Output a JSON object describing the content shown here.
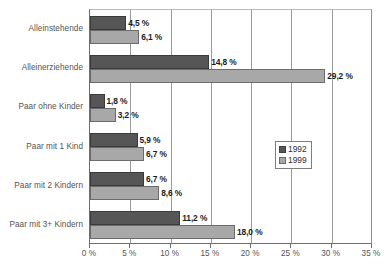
{
  "chart_data": {
    "type": "bar",
    "orientation": "horizontal",
    "title": "",
    "subtitle": "",
    "xlabel": "",
    "ylabel": "",
    "categories": [
      "Alleinstehende",
      "Alleinerziehende",
      "Paar ohne Kinder",
      "Paar mit 1 Kind",
      "Paar mit 2 Kindern",
      "Paar mit 3+ Kindern"
    ],
    "series": [
      {
        "name": "1992",
        "color": "#565656",
        "values": [
          4.5,
          14.8,
          1.8,
          5.9,
          6.7,
          11.2
        ],
        "labels": [
          "4,5 %",
          "14,8 %",
          "1,8 %",
          "5,9 %",
          "6,7 %",
          "11,2 %"
        ]
      },
      {
        "name": "1999",
        "color": "#a8a8a8",
        "values": [
          6.1,
          29.2,
          3.2,
          6.7,
          8.6,
          18.0
        ],
        "labels": [
          "6,1 %",
          "29,2 %",
          "3,2 %",
          "6,7 %",
          "8,6 %",
          "18,0 %"
        ]
      }
    ],
    "xlim": [
      0,
      35
    ],
    "xticks": [
      0,
      5,
      10,
      15,
      20,
      25,
      30,
      35
    ],
    "xtick_labels": [
      "0 %",
      "5 %",
      "10 %",
      "15 %",
      "20 %",
      "25 %",
      "30 %",
      "35 %"
    ],
    "grid": true,
    "grid_axis": "x",
    "legend": {
      "position": "inside-right",
      "entries": [
        "1992",
        "1999"
      ]
    }
  }
}
